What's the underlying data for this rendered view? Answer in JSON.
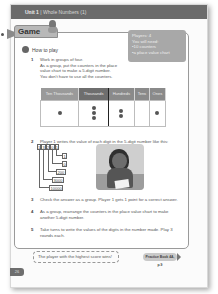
{
  "header": {
    "unit_label": "Unit 1",
    "unit_title": "Whole Numbers (1)"
  },
  "game": {
    "tab_label": "Game",
    "mascot_icon": "mascot-icon"
  },
  "materials": {
    "players": "Players: 4",
    "you_will_need": "You will need:",
    "items": [
      "10 counters",
      "a place value chart"
    ]
  },
  "how_to_play": {
    "badge": "",
    "label": "How to play"
  },
  "steps": [
    {
      "number": "1",
      "lines": [
        "Work in groups of four.",
        "As a group, put the counters in the place",
        "value chart to make a 5-digit number.",
        "You don't have to use all the counters."
      ]
    },
    {
      "number": "2",
      "lines": [
        "Player 1 writes the value of each digit in the 5-digit number like this:"
      ]
    },
    {
      "number": "3",
      "lines": [
        "Check the answer as a group. Player 1 gets 1 point for a correct answer."
      ]
    },
    {
      "number": "4",
      "lines": [
        "As a group, rearrange the counters in the place value chart to make",
        "another 5-digit number."
      ]
    },
    {
      "number": "5",
      "lines": [
        "Take turns to write the values of the digits in the number made. Play 3",
        "rounds each."
      ]
    }
  ],
  "place_value_chart": {
    "headers": [
      "Ten Thousands",
      "Thousands",
      "Hundreds",
      "Tens",
      "Ones"
    ],
    "counters": [
      1,
      3,
      2,
      0,
      1
    ]
  },
  "expansion": {
    "number_digits": [
      "1",
      "3",
      "2",
      "0",
      "1"
    ],
    "values": [
      "1",
      "0",
      "200",
      "3000",
      "10000"
    ]
  },
  "photo": {
    "description": "girl-writing-photo"
  },
  "footer": {
    "winner_text": "The player with the highest score wins!",
    "practice_label": "Practice Book 4A, p.9",
    "page_number": "26"
  }
}
